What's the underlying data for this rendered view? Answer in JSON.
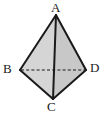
{
  "figure": {
    "kind": "tetrahedron-diagram",
    "background_color": "#ffffff",
    "edge_color": "#1a1a1a",
    "label_color": "#1a1a1a",
    "face_left_color": "#d8d8d8",
    "face_right_color": "#c9c9c9",
    "face_bottom_left_color": "#d2d2d2",
    "face_bottom_right_color": "#c4c4c4",
    "vertices": [
      {
        "name": "A",
        "label": "A",
        "x": 56,
        "y": 15,
        "label_x": 51,
        "label_y": 1
      },
      {
        "name": "B",
        "label": "B",
        "x": 20,
        "y": 70,
        "label_x": 3,
        "label_y": 62
      },
      {
        "name": "C",
        "label": "C",
        "x": 53,
        "y": 99,
        "label_x": 47,
        "label_y": 100
      },
      {
        "name": "D",
        "label": "D",
        "x": 86,
        "y": 70,
        "label_x": 90,
        "label_y": 61
      }
    ],
    "edges": [
      {
        "name": "A-B",
        "from": "A",
        "to": "B",
        "style": "solid"
      },
      {
        "name": "A-D",
        "from": "A",
        "to": "D",
        "style": "solid"
      },
      {
        "name": "A-C",
        "from": "A",
        "to": "C",
        "style": "solid"
      },
      {
        "name": "B-C",
        "from": "B",
        "to": "C",
        "style": "solid"
      },
      {
        "name": "C-D",
        "from": "C",
        "to": "D",
        "style": "solid"
      },
      {
        "name": "B-D",
        "from": "B",
        "to": "D",
        "style": "dashed"
      }
    ]
  }
}
